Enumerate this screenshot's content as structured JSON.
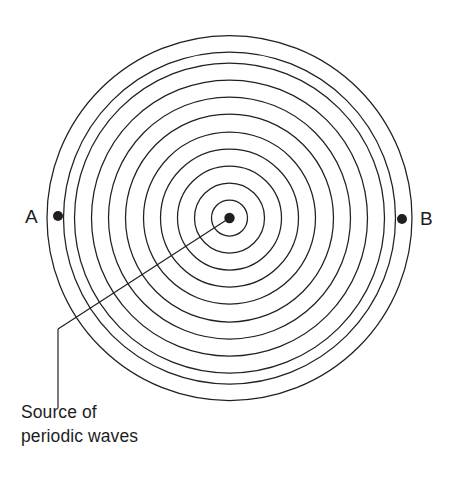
{
  "figure": {
    "background_color": "#ffffff",
    "stroke_color": "#231f20",
    "text_color": "#1d1d1d"
  },
  "caption": {
    "line1": "Source of",
    "line2": "periodic waves"
  },
  "points": {
    "a": {
      "label": "A",
      "x": 58,
      "y": 216
    },
    "b": {
      "label": "B",
      "x": 402,
      "y": 219
    },
    "source": {
      "label": "Source of periodic waves",
      "x": 229.5,
      "y": 218,
      "dot_radius": 5.2
    }
  },
  "chart_data": {
    "type": "scatter",
    "xlabel": "",
    "ylabel": "",
    "center": [
      229.5,
      218
    ],
    "wavefront_count": 11,
    "wavefront_radii": [
      18,
      35,
      52,
      69,
      86,
      104,
      121,
      138,
      155,
      166,
      182.5
    ],
    "annotations": [
      "A",
      "B",
      "Source of periodic waves"
    ],
    "grid": false,
    "legend": "none"
  },
  "leader_line": {
    "from": [
      229.5,
      218
    ],
    "bend": [
      58,
      329
    ],
    "to": [
      58,
      408
    ]
  }
}
